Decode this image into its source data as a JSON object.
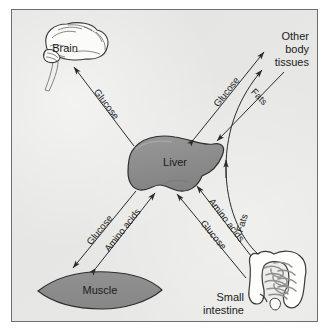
{
  "figure": {
    "background_color": "#e9e9e7",
    "border_color": "#6e6e6e",
    "organ_fill_color": "#8c8c8c",
    "organ_outline_color": "#2e2e2e",
    "arrow_color": "#2b2b2b",
    "text_color": "#1b1b1b"
  },
  "nodes": [
    {
      "id": "brain",
      "label": "Brain",
      "icon": "brain-icon",
      "label_position": "inside"
    },
    {
      "id": "other_body_tissues",
      "label_lines": [
        "Other",
        "body",
        "tissues"
      ],
      "icon": "none",
      "label_position": "standalone"
    },
    {
      "id": "liver",
      "label": "Liver",
      "icon": "liver-icon",
      "label_position": "inside"
    },
    {
      "id": "muscle",
      "label": "Muscle",
      "icon": "muscle-icon",
      "label_position": "inside"
    },
    {
      "id": "small_intestine",
      "label_lines": [
        "Small",
        "intestine"
      ],
      "icon": "intestine-icon",
      "label_position": "beside"
    }
  ],
  "edges": [
    {
      "id": "liver-brain",
      "label": "Glucose",
      "from": "liver",
      "to": "brain",
      "direction": "one-way"
    },
    {
      "id": "liver-other-glucose",
      "label": "Glucose",
      "from": "liver",
      "to": "other_body_tissues",
      "direction": "two-way"
    },
    {
      "id": "other-liver-fats",
      "label": "Fats",
      "from": "other_body_tissues",
      "to": "liver",
      "direction": "one-way"
    },
    {
      "id": "liver-muscle-glucose",
      "label": "Glucose",
      "from": "liver",
      "to": "muscle",
      "direction": "one-way"
    },
    {
      "id": "muscle-liver-amino",
      "label": "Amino acids",
      "from": "muscle",
      "to": "liver",
      "direction": "two-way"
    },
    {
      "id": "intestine-liver-amino",
      "label": "Amino acids",
      "from": "small_intestine",
      "to": "liver",
      "direction": "one-way"
    },
    {
      "id": "intestine-liver-glucose",
      "label": "Glucose",
      "from": "small_intestine",
      "to": "liver",
      "direction": "one-way"
    },
    {
      "id": "intestine-other-fats",
      "label": "Fats",
      "from": "small_intestine",
      "to": "other_body_tissues",
      "direction": "one-way"
    }
  ],
  "labels": {
    "brain": "Brain",
    "liver": "Liver",
    "muscle": "Muscle",
    "other_line1": "Other",
    "other_line2": "body",
    "other_line3": "tissues",
    "intestine_line1": "Small",
    "intestine_line2": "intestine",
    "glucose": "Glucose",
    "fats": "Fats",
    "amino_acids": "Amino acids"
  }
}
